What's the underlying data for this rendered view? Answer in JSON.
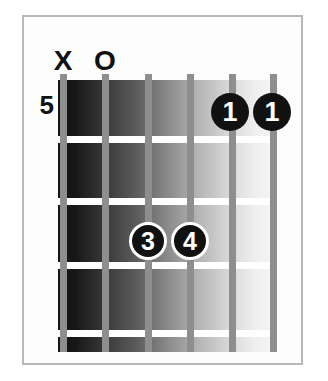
{
  "diagram": {
    "type": "guitar-chord-diagram",
    "instrument": "guitar",
    "strings_count": 6,
    "frets_count": 4,
    "start_fret_label": "5",
    "string_order": "low-to-high-left-to-right",
    "top_markers": [
      {
        "string": 1,
        "symbol": "X",
        "meaning": "muted"
      },
      {
        "string": 2,
        "symbol": "O",
        "meaning": "open"
      },
      {
        "string": 3,
        "symbol": "",
        "meaning": "none"
      },
      {
        "string": 4,
        "symbol": "",
        "meaning": "none"
      },
      {
        "string": 5,
        "symbol": "",
        "meaning": "none"
      },
      {
        "string": 6,
        "symbol": "",
        "meaning": "none"
      }
    ],
    "fingerings": [
      {
        "label": "1",
        "string": 5,
        "fret": 1,
        "style": "plain"
      },
      {
        "label": "1",
        "string": 6,
        "fret": 1,
        "style": "plain"
      },
      {
        "label": "3",
        "string": 3,
        "fret": 3,
        "style": "ringed"
      },
      {
        "label": "4",
        "string": 4,
        "fret": 3,
        "style": "ringed"
      }
    ],
    "colors": {
      "dot_fill": "#111111",
      "dot_text": "#ffffff",
      "dot_ring": "#ffffff",
      "string": "#8e8e8e",
      "fret_line": "#ffffff",
      "frame_border": "#b8b8b8",
      "background": "#ffffff",
      "board_dark": "#1a1a1a",
      "board_light": "#f2f2f2"
    }
  }
}
